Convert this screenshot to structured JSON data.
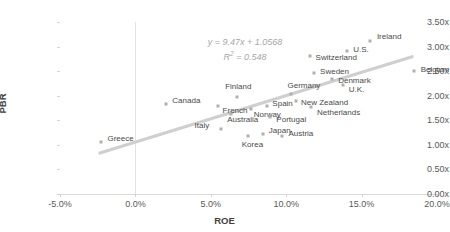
{
  "chart_data": {
    "type": "scatter",
    "title": "",
    "xlabel": "ROE",
    "ylabel": "PBR",
    "xlim": [
      -0.05,
      0.2
    ],
    "ylim": [
      0.0,
      3.5
    ],
    "xticks": [
      "-5.0%",
      "0.0%",
      "5.0%",
      "10.0%",
      "15.0%",
      "20.0%"
    ],
    "xtick_values": [
      -0.05,
      0.0,
      0.05,
      0.1,
      0.15,
      0.2
    ],
    "yticks": [
      "0.00x",
      "0.50x",
      "1.00x",
      "1.50x",
      "2.00x",
      "2.50x",
      "3.00x",
      "3.50x"
    ],
    "ytick_values": [
      0.0,
      0.5,
      1.0,
      1.5,
      2.0,
      2.5,
      3.0,
      3.5
    ],
    "grid": false,
    "legend": false,
    "marker_color": "#b0b0b0",
    "trendline": {
      "equation": "y = 9.47x + 1.0568",
      "r_squared_label": "R",
      "r_squared_sup": "2",
      "r_squared_value": " = 0.548",
      "slope": 9.47,
      "intercept": 1.0568,
      "r_squared": 0.548,
      "color": "#cfcfcf",
      "x_start": -0.0235,
      "x_end": 0.1835
    },
    "points": [
      {
        "name": "Greece",
        "x": -0.0225,
        "y": 1.06,
        "label_dx": 6,
        "label_dy": -3
      },
      {
        "name": "Canada",
        "x": 0.0205,
        "y": 1.84,
        "label_dx": 6,
        "label_dy": -3
      },
      {
        "name": "French",
        "x": 0.0545,
        "y": 1.79,
        "label_dx": 5,
        "label_dy": 5
      },
      {
        "name": "Italy",
        "x": 0.0565,
        "y": 1.32,
        "label_dx": -26,
        "label_dy": -3
      },
      {
        "name": "Australia",
        "x": 0.0635,
        "y": 1.63,
        "label_dx": -4,
        "label_dy": 6
      },
      {
        "name": "Finland",
        "x": 0.0675,
        "y": 1.98,
        "label_dx": -12,
        "label_dy": -10
      },
      {
        "name": "Korea",
        "x": 0.0745,
        "y": 1.19,
        "label_dx": -6,
        "label_dy": 9
      },
      {
        "name": "Norway",
        "x": 0.0765,
        "y": 1.72,
        "label_dx": 3,
        "label_dy": 6
      },
      {
        "name": "Japan",
        "x": 0.0845,
        "y": 1.23,
        "label_dx": 6,
        "label_dy": -3
      },
      {
        "name": "Spain",
        "x": 0.0875,
        "y": 1.8,
        "label_dx": 5,
        "label_dy": -2
      },
      {
        "name": "Portugal",
        "x": 0.0895,
        "y": 1.56,
        "label_dx": 6,
        "label_dy": 3
      },
      {
        "name": "Austria",
        "x": 0.0975,
        "y": 1.19,
        "label_dx": 6,
        "label_dy": -2
      },
      {
        "name": "Germany",
        "x": 0.1035,
        "y": 2.04,
        "label_dx": -4,
        "label_dy": -8
      },
      {
        "name": "New Zealand",
        "x": 0.1065,
        "y": 1.89,
        "label_dx": 5,
        "label_dy": 2
      },
      {
        "name": "Netherlands",
        "x": 0.1165,
        "y": 1.78,
        "label_dx": 6,
        "label_dy": 6
      },
      {
        "name": "Sweden",
        "x": 0.1185,
        "y": 2.46,
        "label_dx": 6,
        "label_dy": -1
      },
      {
        "name": "Switzerland",
        "x": 0.1155,
        "y": 2.8,
        "label_dx": 6,
        "label_dy": 2
      },
      {
        "name": "Denmark",
        "x": 0.1305,
        "y": 2.33,
        "label_dx": 6,
        "label_dy": 2
      },
      {
        "name": "U.K.",
        "x": 0.1375,
        "y": 2.21,
        "label_dx": 6,
        "label_dy": 5
      },
      {
        "name": "U.S.",
        "x": 0.1405,
        "y": 2.92,
        "label_dx": 6,
        "label_dy": -1
      },
      {
        "name": "Ireland",
        "x": 0.1555,
        "y": 3.12,
        "label_dx": 7,
        "label_dy": -4
      },
      {
        "name": "Belgium",
        "x": 0.1845,
        "y": 2.5,
        "label_dx": 7,
        "label_dy": -1
      }
    ]
  }
}
